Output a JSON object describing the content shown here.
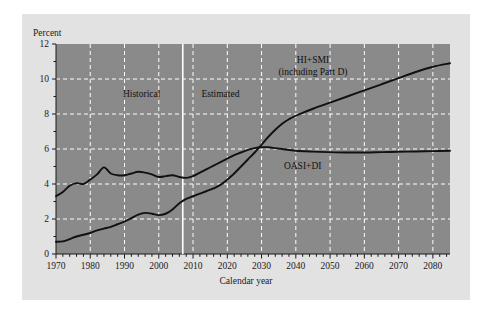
{
  "chart_data": {
    "type": "line",
    "title": "",
    "xlabel": "Calendar year",
    "ylabel": "Percent",
    "xlim": [
      1970,
      2085
    ],
    "ylim": [
      0,
      12
    ],
    "yticks": [
      0,
      2,
      4,
      6,
      8,
      10,
      12
    ],
    "xticks": [
      1970,
      1980,
      1990,
      2000,
      2010,
      2020,
      2030,
      2040,
      2050,
      2060,
      2070,
      2080
    ],
    "xminor_step": 2,
    "grid": true,
    "grid_style": "dashed-white",
    "plot_background": "#8a8a8a",
    "figure_background": "#e2e2e2",
    "line_color": "#111111",
    "annotations": [
      {
        "name": "historical",
        "text": "Historical",
        "x": 1995,
        "y": 9.0
      },
      {
        "name": "estimated",
        "text": "Estimated",
        "x": 2018,
        "y": 9.0
      },
      {
        "name": "divider",
        "text": "",
        "x": 2007,
        "y": 0
      }
    ],
    "divider_year": 2007,
    "series": [
      {
        "name": "HI+SMI (including Part D)",
        "label_lines": [
          "HI+SMI",
          "(including Part D)"
        ],
        "label_x": 2045,
        "label_y": 10.9,
        "x": [
          1970,
          1972,
          1974,
          1976,
          1978,
          1980,
          1982,
          1984,
          1986,
          1988,
          1990,
          1992,
          1994,
          1996,
          1998,
          2000,
          2002,
          2004,
          2006,
          2008,
          2010,
          2012,
          2014,
          2016,
          2018,
          2020,
          2022,
          2024,
          2026,
          2028,
          2030,
          2032,
          2034,
          2036,
          2038,
          2040,
          2045,
          2050,
          2055,
          2060,
          2065,
          2070,
          2075,
          2080,
          2085
        ],
        "y": [
          0.7,
          0.72,
          0.85,
          1.0,
          1.1,
          1.2,
          1.35,
          1.45,
          1.55,
          1.7,
          1.85,
          2.05,
          2.25,
          2.35,
          2.3,
          2.22,
          2.3,
          2.55,
          2.9,
          3.15,
          3.3,
          3.45,
          3.6,
          3.75,
          3.95,
          4.25,
          4.6,
          5.0,
          5.4,
          5.8,
          6.25,
          6.7,
          7.1,
          7.45,
          7.7,
          7.9,
          8.3,
          8.65,
          9.0,
          9.35,
          9.7,
          10.05,
          10.4,
          10.7,
          10.9
        ]
      },
      {
        "name": "OASI+DI",
        "label_lines": [
          "OASI+DI"
        ],
        "label_x": 2042,
        "label_y": 4.85,
        "x": [
          1970,
          1972,
          1974,
          1976,
          1978,
          1980,
          1982,
          1984,
          1986,
          1988,
          1990,
          1992,
          1994,
          1996,
          1998,
          2000,
          2002,
          2004,
          2006,
          2008,
          2010,
          2012,
          2014,
          2016,
          2018,
          2020,
          2022,
          2024,
          2026,
          2028,
          2030,
          2032,
          2034,
          2036,
          2040,
          2045,
          2050,
          2055,
          2060,
          2065,
          2070,
          2075,
          2080,
          2085
        ],
        "y": [
          3.3,
          3.55,
          3.9,
          4.05,
          4.0,
          4.25,
          4.55,
          4.95,
          4.6,
          4.5,
          4.5,
          4.6,
          4.7,
          4.65,
          4.55,
          4.4,
          4.45,
          4.5,
          4.4,
          4.35,
          4.45,
          4.65,
          4.85,
          5.05,
          5.25,
          5.45,
          5.65,
          5.8,
          5.95,
          6.05,
          6.1,
          6.1,
          6.05,
          6.0,
          5.9,
          5.85,
          5.82,
          5.8,
          5.8,
          5.82,
          5.84,
          5.86,
          5.88,
          5.9
        ]
      }
    ]
  }
}
